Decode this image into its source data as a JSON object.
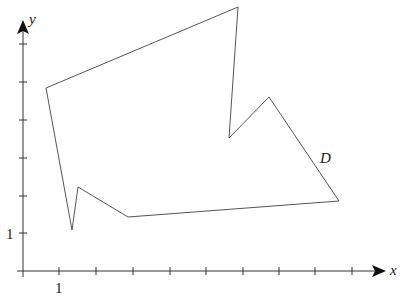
{
  "figure": {
    "region_label": "D",
    "x_axis_label": "x",
    "y_axis_label": "y",
    "x_tick_label": "1",
    "y_tick_label": "1"
  },
  "axes": {
    "origin_px": [
      23,
      271
    ],
    "x_ticks_px": [
      59,
      96,
      133,
      170,
      206,
      243,
      279,
      315,
      352
    ],
    "y_ticks_px": [
      233,
      196,
      158,
      120,
      82,
      44
    ],
    "x_arrow_tip_px": [
      386,
      271
    ],
    "y_arrow_tip_px": [
      23,
      20
    ]
  },
  "polygon": {
    "name": "D",
    "stroke": "#555555",
    "vertices_px": [
      [
        46,
        88
      ],
      [
        238,
        7
      ],
      [
        229,
        138
      ],
      [
        269,
        97
      ],
      [
        339,
        201
      ],
      [
        128,
        217
      ],
      [
        78,
        187
      ],
      [
        72,
        230
      ]
    ],
    "vertices_approx_units": [
      [
        0.6,
        4.85
      ],
      [
        5.9,
        7.0
      ],
      [
        5.6,
        3.5
      ],
      [
        6.7,
        4.6
      ],
      [
        8.6,
        1.9
      ],
      [
        2.9,
        1.4
      ],
      [
        1.5,
        2.2
      ],
      [
        1.35,
        1.1
      ]
    ]
  }
}
